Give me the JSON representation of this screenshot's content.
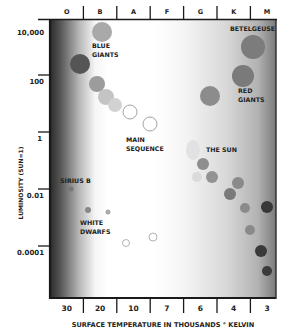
{
  "chart_data": {
    "type": "scatter",
    "xlabel": "SURFACE TEMPERATURE IN THOUSANDS ° KELVIN",
    "ylabel": "LUMINOSITY (SUN=1)",
    "x_tick_labels": [
      "30",
      "20",
      "10",
      "7",
      "6",
      "4",
      "3"
    ],
    "spectral_classes": [
      "O",
      "B",
      "A",
      "F",
      "G",
      "K",
      "M"
    ],
    "y_tick_labels": [
      "10,000",
      "100",
      "1",
      "0.01",
      "0.0001"
    ],
    "x_axis_reversed": true,
    "y_scale": "log",
    "annotations": [
      {
        "text_lines": [
          "BLUE",
          "GIANTS"
        ],
        "x": 92,
        "y": 48
      },
      {
        "text_lines": [
          "BETELGEUSE"
        ],
        "x": 230,
        "y": 31
      },
      {
        "text_lines": [
          "RED",
          "GIANTS"
        ],
        "x": 238,
        "y": 93
      },
      {
        "text_lines": [
          "MAIN",
          "SEQUENCE"
        ],
        "x": 126,
        "y": 142
      },
      {
        "text_lines": [
          "THE SUN"
        ],
        "x": 206,
        "y": 152
      },
      {
        "text_lines": [
          "SIRIUS B"
        ],
        "x": 60,
        "y": 183
      },
      {
        "text_lines": [
          "WHITE",
          "DWARFS"
        ],
        "x": 80,
        "y": 225
      }
    ],
    "stars": [
      {
        "group": "main-sequence",
        "cx": 102,
        "cy": 32,
        "r": 10,
        "fill": "#a9a9a9"
      },
      {
        "group": "main-sequence",
        "cx": 80,
        "cy": 64,
        "r": 10,
        "fill": "#555555"
      },
      {
        "group": "main-sequence",
        "cx": 97,
        "cy": 84,
        "r": 8,
        "fill": "#9c9c9c"
      },
      {
        "group": "main-sequence",
        "cx": 106,
        "cy": 97,
        "r": 8,
        "fill": "#c4c4c4"
      },
      {
        "group": "main-sequence",
        "cx": 115,
        "cy": 105,
        "r": 7,
        "fill": "#d2d2d2"
      },
      {
        "group": "main-sequence",
        "cx": 130,
        "cy": 112,
        "r": 7,
        "fill": "none",
        "stroke": "#999999"
      },
      {
        "group": "main-sequence",
        "cx": 150,
        "cy": 124,
        "r": 7,
        "fill": "none",
        "stroke": "#999999"
      },
      {
        "group": "sun",
        "cx": 193,
        "cy": 150,
        "r": 7,
        "ry": 10,
        "fill": "#e2e2e2"
      },
      {
        "group": "main-sequence",
        "cx": 203,
        "cy": 164,
        "r": 6,
        "fill": "#8e8e8e"
      },
      {
        "group": "main-sequence",
        "cx": 197,
        "cy": 177,
        "r": 5,
        "fill": "#dadada"
      },
      {
        "group": "main-sequence",
        "cx": 212,
        "cy": 177,
        "r": 6,
        "fill": "#939393"
      },
      {
        "group": "main-sequence",
        "cx": 238,
        "cy": 183,
        "r": 6,
        "fill": "#8a8a8a"
      },
      {
        "group": "main-sequence",
        "cx": 230,
        "cy": 194,
        "r": 6,
        "fill": "#7a7a7a"
      },
      {
        "group": "main-sequence",
        "cx": 245,
        "cy": 208,
        "r": 5,
        "fill": "#8a8a8a"
      },
      {
        "group": "main-sequence",
        "cx": 267,
        "cy": 207,
        "r": 6,
        "fill": "#383838"
      },
      {
        "group": "main-sequence",
        "cx": 250,
        "cy": 230,
        "r": 5,
        "fill": "#8a8a8a"
      },
      {
        "group": "main-sequence",
        "cx": 261,
        "cy": 251,
        "r": 6,
        "fill": "#3a3a3a"
      },
      {
        "group": "main-sequence",
        "cx": 267,
        "cy": 271,
        "r": 5,
        "fill": "#3a3a3a"
      },
      {
        "group": "red-giant",
        "cx": 253,
        "cy": 47,
        "r": 12,
        "fill": "#7c7c7c"
      },
      {
        "group": "red-giant",
        "cx": 243,
        "cy": 76,
        "r": 11,
        "fill": "#7a7a7a"
      },
      {
        "group": "red-giant",
        "cx": 210,
        "cy": 96,
        "r": 10,
        "fill": "#8c8c8c"
      },
      {
        "group": "white-dwarf",
        "cx": 71,
        "cy": 189,
        "r": 2.5,
        "fill": "#777777"
      },
      {
        "group": "white-dwarf",
        "cx": 88,
        "cy": 210,
        "r": 3,
        "fill": "#888888"
      },
      {
        "group": "white-dwarf",
        "cx": 108,
        "cy": 212,
        "r": 2.5,
        "fill": "#aaaaaa"
      },
      {
        "group": "white-dwarf",
        "cx": 126,
        "cy": 243,
        "r": 3.5,
        "fill": "none",
        "stroke": "#aaaaaa"
      },
      {
        "group": "white-dwarf",
        "cx": 153,
        "cy": 237,
        "r": 4,
        "fill": "none",
        "stroke": "#aaaaaa"
      }
    ]
  },
  "colors": {
    "frame": "#1a1a1a",
    "hot_edge": "#2a2a2a",
    "cool_edge": "#6e6e6e",
    "text": "#222222"
  }
}
